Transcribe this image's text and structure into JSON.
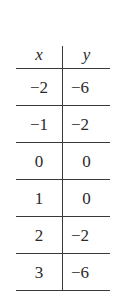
{
  "table": {
    "headers": {
      "x": "x",
      "y": "y"
    },
    "rows": [
      {
        "x": "−2",
        "y": "−6"
      },
      {
        "x": "−1",
        "y": "−2"
      },
      {
        "x": "0",
        "y": "0"
      },
      {
        "x": "1",
        "y": "0"
      },
      {
        "x": "2",
        "y": "−2"
      },
      {
        "x": "3",
        "y": "−6"
      }
    ]
  }
}
